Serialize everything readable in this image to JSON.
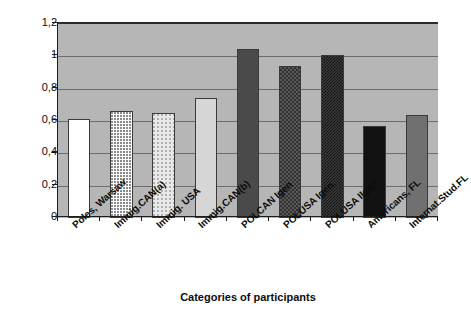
{
  "chart_data": {
    "type": "bar",
    "title": "",
    "xlabel": "Categories of participants",
    "ylabel": "",
    "ylim": [
      0,
      1.2
    ],
    "grid": true,
    "legend": "none",
    "decimal_separator": ",",
    "ytick_labels": [
      "1,2",
      "1",
      "0,8",
      "0,6",
      "0,4",
      "0,2",
      "0"
    ],
    "ytick_values": [
      1.2,
      1.0,
      0.8,
      0.6,
      0.4,
      0.2,
      0
    ],
    "categories": [
      "Poles, Warsaw",
      "Immig.CAN(a)",
      "Immig. USA",
      "Immig.CAN(b)",
      "POLCAN Igen",
      "POLUSA Igen.",
      "POLUSA IIgen",
      "Americans, FL",
      "Internat.Stud.FL"
    ],
    "values": [
      0.61,
      0.665,
      0.65,
      0.74,
      1.045,
      0.94,
      1.01,
      0.57,
      0.635
    ],
    "bar_styles": [
      "solid-white",
      "fine-dotted",
      "light-dotted",
      "light-gray",
      "dark-gray",
      "checkered",
      "dense-crosshatch",
      "solid-black",
      "medium-gray"
    ],
    "colors": {
      "plot_background": "#b6b6b6",
      "gridline": "#6d6d6d",
      "axis": "#1d1d1d",
      "text": "#0d0d0d",
      "page_background": "#ffffff"
    }
  }
}
